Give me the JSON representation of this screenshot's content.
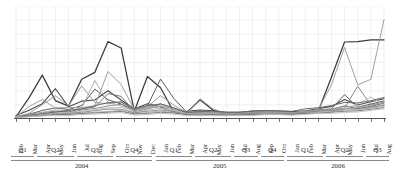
{
  "chart_data": {
    "type": "line",
    "title": "",
    "subtitle": "",
    "xlabel": "",
    "ylabel": "",
    "grid": true,
    "legend": "none",
    "ylim": [
      0,
      100
    ],
    "x_tick_labels": [
      "Feb",
      "Mar",
      "Apr",
      "May",
      "Jun",
      "Jul",
      "Aug",
      "Sep",
      "Oct",
      "Nov",
      "Dec",
      "Jan",
      "Feb",
      "Mar",
      "Apr",
      "May",
      "Jun",
      "Jul",
      "Aug",
      "Sep",
      "Oct",
      "Jan",
      "Feb",
      "Mar",
      "Apr",
      "May",
      "Jun",
      "Jul",
      "Aug"
    ],
    "quarter_groups": [
      {
        "label": "Q1",
        "start_index": 0,
        "end_index": 1
      },
      {
        "label": "Q2",
        "start_index": 2,
        "end_index": 4
      },
      {
        "label": "Q3",
        "start_index": 5,
        "end_index": 7
      },
      {
        "label": "Q4",
        "start_index": 8,
        "end_index": 10
      },
      {
        "label": "Q1",
        "start_index": 11,
        "end_index": 13
      },
      {
        "label": "Q2",
        "start_index": 14,
        "end_index": 16
      },
      {
        "label": "Q3",
        "start_index": 17,
        "end_index": 18
      },
      {
        "label": "Q4",
        "start_index": 19,
        "end_index": 20
      },
      {
        "label": "Q1",
        "start_index": 21,
        "end_index": 23
      },
      {
        "label": "Q2",
        "start_index": 24,
        "end_index": 26
      },
      {
        "label": "Q3",
        "start_index": 27,
        "end_index": 28
      }
    ],
    "year_groups": [
      {
        "label": "2004",
        "start_index": 0,
        "end_index": 10
      },
      {
        "label": "2005",
        "start_index": 11,
        "end_index": 20
      },
      {
        "label": "2006",
        "start_index": 21,
        "end_index": 28
      }
    ],
    "colors": {
      "dark": "#3a3a3a",
      "mid": "#6e6e6e",
      "light": "#a8a8a8",
      "pale": "#c4c4c4",
      "grid": "#e9e9ec",
      "axis": "#555555"
    },
    "series": [
      {
        "name": "series-1",
        "color": "#3a3a3a",
        "width": 1.25,
        "values": [
          2,
          4,
          42,
          38,
          18,
          8,
          14,
          36,
          12,
          94,
          60,
          72,
          8,
          6,
          40,
          36,
          10,
          5,
          6,
          4,
          30,
          5,
          4,
          5,
          4,
          5,
          5,
          6,
          5,
          4,
          6,
          5,
          7,
          6,
          78,
          66,
          68,
          70,
          70,
          70
        ]
      },
      {
        "name": "series-2",
        "color": "#4a4a4a",
        "width": 1.1,
        "values": [
          3,
          5,
          12,
          14,
          30,
          12,
          10,
          16,
          14,
          22,
          26,
          18,
          10,
          8,
          14,
          12,
          8,
          6,
          7,
          6,
          10,
          7,
          6,
          6,
          6,
          7,
          7,
          8,
          7,
          6,
          8,
          7,
          9,
          9,
          14,
          18,
          12,
          14,
          16,
          18
        ]
      },
      {
        "name": "series-3",
        "color": "#5c5c5c",
        "width": 1.0,
        "values": [
          2,
          3,
          6,
          8,
          10,
          9,
          8,
          12,
          30,
          20,
          16,
          14,
          9,
          7,
          12,
          36,
          34,
          12,
          6,
          5,
          8,
          6,
          5,
          5,
          5,
          6,
          6,
          7,
          6,
          5,
          7,
          6,
          8,
          8,
          10,
          24,
          10,
          12,
          14,
          16
        ]
      },
      {
        "name": "series-4",
        "color": "#787878",
        "width": 1.0,
        "values": [
          2,
          3,
          5,
          6,
          7,
          7,
          6,
          9,
          10,
          12,
          26,
          22,
          8,
          6,
          10,
          14,
          12,
          9,
          5,
          4,
          7,
          5,
          4,
          5,
          4,
          5,
          5,
          6,
          5,
          4,
          6,
          6,
          7,
          7,
          9,
          12,
          9,
          10,
          12,
          14
        ]
      },
      {
        "name": "series-5",
        "color": "#8c8c8c",
        "width": 1.0,
        "values": [
          2,
          3,
          4,
          5,
          6,
          6,
          5,
          8,
          9,
          10,
          12,
          14,
          7,
          6,
          9,
          12,
          11,
          8,
          5,
          4,
          6,
          5,
          4,
          4,
          4,
          5,
          5,
          6,
          5,
          4,
          6,
          6,
          7,
          7,
          8,
          10,
          34,
          11,
          13,
          15
        ]
      },
      {
        "name": "series-6",
        "color": "#a0a0a0",
        "width": 1.0,
        "values": [
          2,
          4,
          22,
          16,
          10,
          8,
          12,
          10,
          8,
          18,
          50,
          34,
          10,
          7,
          12,
          10,
          8,
          6,
          5,
          4,
          32,
          6,
          5,
          5,
          5,
          6,
          6,
          7,
          6,
          5,
          7,
          6,
          8,
          8,
          60,
          64,
          36,
          9,
          52,
          88
        ]
      },
      {
        "name": "series-7",
        "color": "#b2b2b2",
        "width": 1.0,
        "values": [
          2,
          3,
          5,
          6,
          8,
          8,
          7,
          10,
          44,
          16,
          14,
          12,
          8,
          6,
          10,
          12,
          10,
          7,
          5,
          4,
          6,
          5,
          4,
          4,
          4,
          5,
          5,
          6,
          5,
          4,
          6,
          6,
          7,
          7,
          9,
          10,
          8,
          9,
          11,
          13
        ]
      },
      {
        "name": "series-8",
        "color": "#c0c0c0",
        "width": 1.0,
        "values": [
          2,
          3,
          4,
          5,
          6,
          6,
          5,
          7,
          8,
          9,
          10,
          11,
          6,
          5,
          8,
          10,
          9,
          7,
          4,
          4,
          5,
          4,
          4,
          4,
          4,
          4,
          5,
          5,
          5,
          4,
          5,
          5,
          6,
          6,
          7,
          9,
          8,
          34,
          10,
          12
        ]
      },
      {
        "name": "series-9",
        "color": "#9a9a9a",
        "width": 1.0,
        "values": [
          2,
          3,
          8,
          14,
          22,
          14,
          10,
          30,
          16,
          12,
          14,
          16,
          9,
          7,
          11,
          22,
          18,
          10,
          6,
          5,
          7,
          6,
          5,
          5,
          5,
          6,
          6,
          7,
          6,
          5,
          7,
          7,
          8,
          8,
          10,
          12,
          10,
          11,
          13,
          15
        ]
      },
      {
        "name": "series-10",
        "color": "#6a6a6a",
        "width": 1.0,
        "values": [
          2,
          3,
          4,
          5,
          6,
          7,
          8,
          9,
          11,
          13,
          15,
          16,
          10,
          8,
          12,
          14,
          12,
          9,
          6,
          5,
          8,
          7,
          6,
          6,
          6,
          7,
          7,
          8,
          7,
          6,
          9,
          9,
          10,
          11,
          13,
          15,
          14,
          15,
          17,
          19
        ]
      },
      {
        "name": "series-11",
        "color": "#858585",
        "width": 0.9,
        "values": [
          2,
          2,
          3,
          4,
          5,
          5,
          5,
          6,
          7,
          8,
          9,
          9,
          6,
          5,
          7,
          8,
          8,
          6,
          4,
          4,
          5,
          4,
          4,
          4,
          4,
          5,
          5,
          5,
          5,
          4,
          6,
          6,
          7,
          7,
          8,
          9,
          9,
          10,
          11,
          12
        ]
      },
      {
        "name": "series-12",
        "color": "#aaaaaa",
        "width": 0.9,
        "values": [
          2,
          2,
          3,
          3,
          4,
          4,
          4,
          5,
          6,
          6,
          7,
          8,
          5,
          4,
          6,
          7,
          7,
          5,
          4,
          3,
          4,
          4,
          3,
          4,
          4,
          4,
          4,
          5,
          4,
          4,
          5,
          5,
          6,
          6,
          7,
          8,
          8,
          9,
          10,
          11
        ]
      },
      {
        "name": "series-13",
        "color": "#707070",
        "width": 0.9,
        "values": [
          1,
          2,
          3,
          3,
          4,
          4,
          4,
          5,
          5,
          6,
          6,
          7,
          5,
          4,
          5,
          6,
          6,
          5,
          4,
          3,
          4,
          4,
          3,
          3,
          4,
          4,
          4,
          4,
          4,
          4,
          5,
          5,
          5,
          6,
          6,
          7,
          7,
          8,
          9,
          10
        ]
      },
      {
        "name": "series-14",
        "color": "#bdbdbd",
        "width": 0.9,
        "values": [
          1,
          2,
          2,
          3,
          3,
          3,
          3,
          4,
          4,
          5,
          5,
          6,
          4,
          3,
          4,
          5,
          5,
          4,
          3,
          3,
          3,
          3,
          3,
          3,
          3,
          3,
          4,
          4,
          4,
          3,
          4,
          4,
          5,
          5,
          5,
          6,
          6,
          7,
          8,
          9
        ]
      }
    ]
  }
}
